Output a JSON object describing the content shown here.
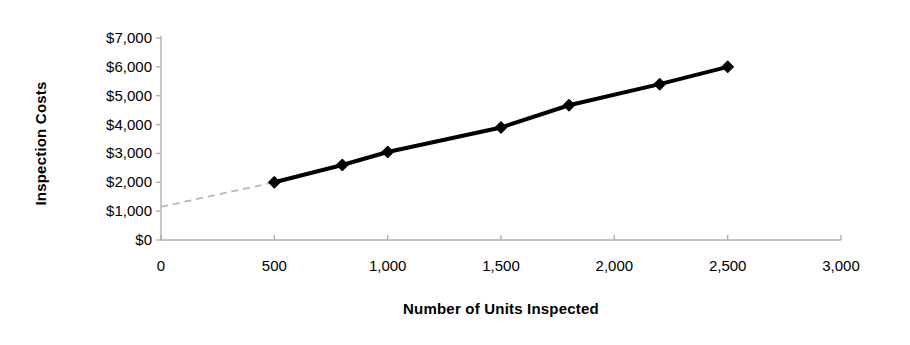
{
  "chart_data": {
    "type": "scatter",
    "title": "",
    "xlabel": "Number of Units Inspected",
    "ylabel": "Inspection Costs",
    "x": [
      500,
      800,
      1000,
      1500,
      1800,
      2200,
      2500
    ],
    "values": [
      2000,
      2600,
      3050,
      3900,
      4670,
      5400,
      6000
    ],
    "series": [
      {
        "name": "Inspection Costs",
        "x": [
          500,
          800,
          1000,
          1500,
          1800,
          2200,
          2500
        ],
        "values": [
          2000,
          2600,
          3050,
          3900,
          4670,
          5400,
          6000
        ],
        "marker": "diamond",
        "marker_color": "#000000",
        "line_color": "#000000",
        "line_width": 4
      }
    ],
    "trendline": {
      "style": "dashed",
      "color": "#b7b7b7",
      "x_start": 0,
      "y_start": 1150,
      "x_end": 500,
      "y_end": 2000
    },
    "xlim": [
      0,
      3000
    ],
    "ylim": [
      0,
      7000
    ],
    "xticks": [
      0,
      500,
      1000,
      1500,
      2000,
      2500,
      3000
    ],
    "xtick_labels": [
      "0",
      "500",
      "1,000",
      "1,500",
      "2,000",
      "2,500",
      "3,000"
    ],
    "yticks": [
      0,
      1000,
      2000,
      3000,
      4000,
      5000,
      6000,
      7000
    ],
    "ytick_labels": [
      "$0",
      "$1,000",
      "$2,000",
      "$3,000",
      "$4,000",
      "$5,000",
      "$6,000",
      "$7,000"
    ],
    "grid": false,
    "legend": "none",
    "axis_color": "#b0b0b0",
    "background_color": "#ffffff"
  }
}
